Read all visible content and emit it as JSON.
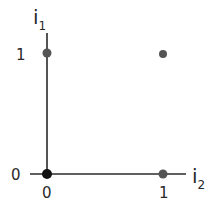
{
  "diagram": {
    "type": "2d-binary-input-space",
    "axes": {
      "x": {
        "label": "i",
        "subscript": "2",
        "ticks": [
          {
            "value": "0",
            "label": "0"
          },
          {
            "value": "1",
            "label": "1"
          }
        ]
      },
      "y": {
        "label": "i",
        "subscript": "1",
        "ticks": [
          {
            "value": "0",
            "label": "0"
          },
          {
            "value": "1",
            "label": "1"
          }
        ]
      }
    },
    "points": [
      {
        "i2": 0,
        "i1": 0,
        "style": "filled-black"
      },
      {
        "i2": 0,
        "i1": 1,
        "style": "filled-gray"
      },
      {
        "i2": 1,
        "i1": 0,
        "style": "filled-gray"
      },
      {
        "i2": 1,
        "i1": 1,
        "style": "filled-gray"
      }
    ],
    "colors": {
      "axis": "#2a2a2a",
      "point": "#555555",
      "origin": "#111111"
    }
  }
}
